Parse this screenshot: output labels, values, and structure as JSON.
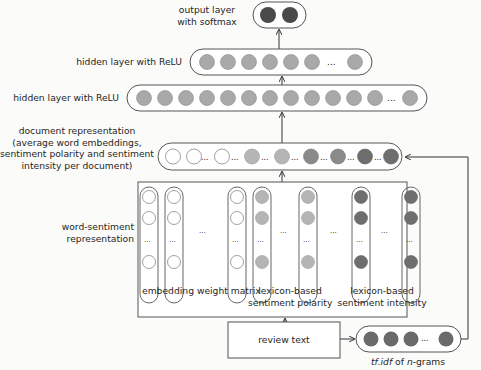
{
  "diagram": {
    "output_layer": {
      "label_line1": "output layer",
      "label_line2": "with softmax",
      "nodes": 2,
      "node_color": "#4a4a4a"
    },
    "hidden_layer_2": {
      "label": "hidden layer with ReLU",
      "nodes_before_ellipsis": 7,
      "ellipsis": "...",
      "nodes_after_ellipsis": 1,
      "node_color": "#a9a9a9"
    },
    "hidden_layer_1": {
      "label": "hidden layer with ReLU",
      "nodes_before_ellipsis": 12,
      "ellipsis": "...",
      "nodes_after_ellipsis": 1,
      "node_color": "#a9a9a9"
    },
    "document_representation": {
      "label_line1": "document representation",
      "label_line2": "(average word embeddings,",
      "label_line3": "sentiment polarity and sentiment",
      "label_line4": "intensity per document)",
      "ellipsis": "..."
    },
    "word_sentiment": {
      "label_line1": "word-sentiment",
      "label_line2": "representation",
      "group1_label": "embedding weight matrix",
      "group2_label_line1": "lexicon-based",
      "group2_label_line2": "sentiment polarity",
      "group3_label_line1": "lexicon-based",
      "group3_label_line2": "sentiment intensity",
      "ellipsis": "..."
    },
    "review_text": {
      "label": "review text"
    },
    "tfidf": {
      "label_tf": "tf.idf",
      "label_of": " of ",
      "label_n": "n",
      "label_grams": "-grams",
      "ellipsis": "...",
      "node_color": "#6a6a6a"
    },
    "colors": {
      "white_node": "#ffffff",
      "light_gray_node": "#b5b5b5",
      "mid_gray_node": "#8a8a8a",
      "dark_gray_node": "#6e6e6e",
      "line": "#3a3a3a"
    }
  }
}
